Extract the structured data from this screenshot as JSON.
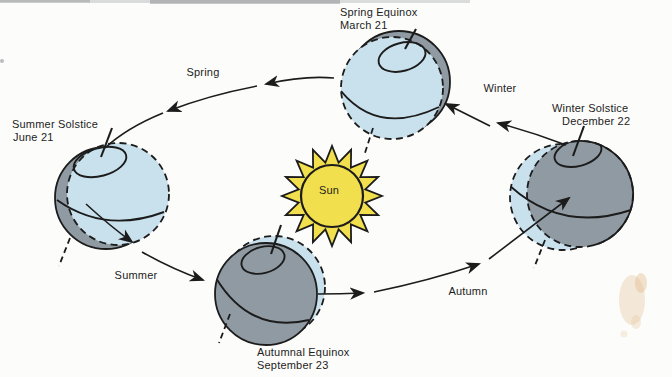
{
  "figure": {
    "colors": {
      "day": "#c9e1ec",
      "night": "#8f9aa2",
      "sun_yellow": "#f2df4e",
      "line": "#1c1c1c",
      "paper": "#fcfcfa",
      "stain": "#e7c9a2"
    },
    "sun": {
      "label": "Sun"
    },
    "markers": {
      "spring_equinox": {
        "title": "Spring Equinox",
        "date": "March 21"
      },
      "summer_solstice": {
        "title": "Summer Solstice",
        "date": "June 21"
      },
      "autumnal_equinox": {
        "title": "Autumnal Equinox",
        "date": "September 23"
      },
      "winter_solstice": {
        "title": "Winter Solstice",
        "date": "December 22"
      }
    },
    "seasons": {
      "spring": "Spring",
      "summer": "Summer",
      "autumn": "Autumn",
      "winter": "Winter"
    }
  }
}
